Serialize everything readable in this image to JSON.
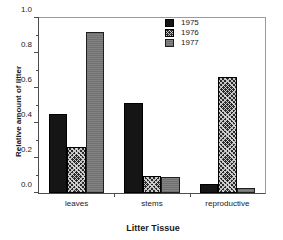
{
  "chart_data": {
    "type": "bar",
    "title": "",
    "xlabel": "Litter Tissue",
    "ylabel": "Relative amount of litter",
    "categories": [
      "leaves",
      "stems",
      "reproductive"
    ],
    "series": [
      {
        "name": "1975",
        "values": [
          0.45,
          0.515,
          0.05
        ],
        "color": "#151515",
        "pattern": "solid-black"
      },
      {
        "name": "1976",
        "values": [
          0.265,
          0.1,
          0.665
        ],
        "color": "#2a2a2a",
        "pattern": "cross-hatch"
      },
      {
        "name": "1977",
        "values": [
          0.92,
          0.09,
          0.03
        ],
        "color": "#7d7d7d",
        "pattern": "solid-gray"
      }
    ],
    "ylim": [
      0.0,
      1.0
    ],
    "ytick_labels": [
      "0.0",
      "0.2",
      "0.4",
      "0.6",
      "0.8",
      "1.0"
    ],
    "ytick_values": [
      0.0,
      0.2,
      0.4,
      0.6,
      0.8,
      1.0
    ],
    "yminor_values": [
      0.1,
      0.3,
      0.5,
      0.7,
      0.9
    ],
    "grid": false,
    "legend_position": "top-right",
    "legend_entries": [
      "1975",
      "1976",
      "1977"
    ]
  }
}
